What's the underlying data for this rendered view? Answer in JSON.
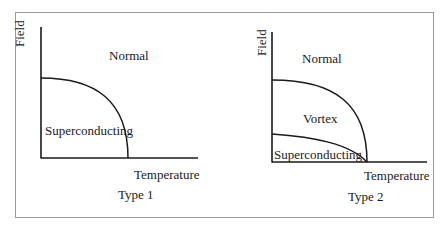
{
  "panels": [
    {
      "id": "type1",
      "caption": "Type 1",
      "y_axis_label": "Field",
      "x_axis_label": "Temperature",
      "regions": [
        "Normal",
        "Superconducting"
      ]
    },
    {
      "id": "type2",
      "caption": "Type 2",
      "y_axis_label": "Field",
      "x_axis_label": "Temperature",
      "regions": [
        "Normal",
        "Vortex",
        "Superconducting"
      ]
    }
  ],
  "colors": {
    "line": "#1a1a1a",
    "frame": "#9a9a9a",
    "background": "#ffffff"
  }
}
